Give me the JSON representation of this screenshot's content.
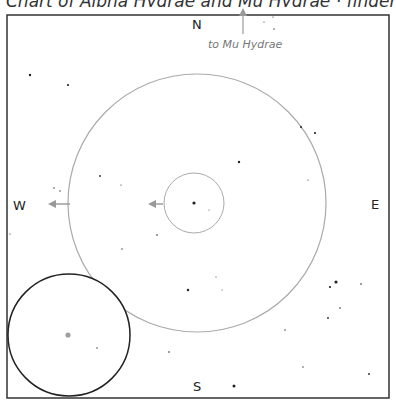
{
  "caption": "Chart of Alpha Hydrae and Mu Hydrae · finder graph",
  "directions": {
    "north": "N",
    "south": "S",
    "east": "E",
    "west": "W"
  },
  "pointer_label": "to Mu Hydrae",
  "colors": {
    "frame": "#333333",
    "finder_circle": "#aaaaaa",
    "eyepiece_circle": "#222222",
    "arrow": "#999999",
    "star": "#222222",
    "target_star": "#888888"
  },
  "frame": {
    "x": 7,
    "y": 15,
    "width": 382,
    "height": 383
  },
  "finder_field": {
    "cx": 197,
    "cy": 203,
    "r": 129
  },
  "low_power_field": {
    "cx": 194,
    "cy": 203,
    "r": 30
  },
  "eyepiece_inset": {
    "cx": 69,
    "cy": 335,
    "r": 61
  },
  "center_star": {
    "x": 194,
    "y": 203,
    "r": 1.6
  },
  "stars": [
    {
      "x": 30,
      "y": 75,
      "r": 1.2
    },
    {
      "x": 68,
      "y": 85,
      "r": 1.1
    },
    {
      "x": 100,
      "y": 176,
      "r": 0.9
    },
    {
      "x": 121,
      "y": 185,
      "r": 0.6
    },
    {
      "x": 54,
      "y": 188,
      "r": 0.7
    },
    {
      "x": 60,
      "y": 191,
      "r": 0.7
    },
    {
      "x": 157,
      "y": 235,
      "r": 0.8
    },
    {
      "x": 122,
      "y": 249,
      "r": 0.7
    },
    {
      "x": 239,
      "y": 162,
      "r": 1.2
    },
    {
      "x": 301,
      "y": 127,
      "r": 1.0
    },
    {
      "x": 315,
      "y": 133,
      "r": 1.1
    },
    {
      "x": 308,
      "y": 180,
      "r": 0.6
    },
    {
      "x": 209,
      "y": 210,
      "r": 0.5
    },
    {
      "x": 188,
      "y": 290,
      "r": 1.2
    },
    {
      "x": 216,
      "y": 277,
      "r": 0.6
    },
    {
      "x": 222,
      "y": 290,
      "r": 0.5
    },
    {
      "x": 336,
      "y": 282,
      "r": 1.6
    },
    {
      "x": 330,
      "y": 287,
      "r": 1.1
    },
    {
      "x": 361,
      "y": 284,
      "r": 0.8
    },
    {
      "x": 340,
      "y": 308,
      "r": 0.8
    },
    {
      "x": 328,
      "y": 318,
      "r": 0.9
    },
    {
      "x": 285,
      "y": 330,
      "r": 0.7
    },
    {
      "x": 169,
      "y": 352,
      "r": 0.8
    },
    {
      "x": 234,
      "y": 386,
      "r": 1.5
    },
    {
      "x": 303,
      "y": 367,
      "r": 0.7
    },
    {
      "x": 369,
      "y": 374,
      "r": 0.9
    },
    {
      "x": 97,
      "y": 348,
      "r": 0.7
    },
    {
      "x": 273,
      "y": 17,
      "r": 0.6
    },
    {
      "x": 264,
      "y": 22,
      "r": 0.6
    },
    {
      "x": 274,
      "y": 29,
      "r": 0.7
    },
    {
      "x": 10,
      "y": 234,
      "r": 0.6
    }
  ],
  "eyepiece_target": {
    "x": 68,
    "y": 335,
    "r": 2.6
  }
}
